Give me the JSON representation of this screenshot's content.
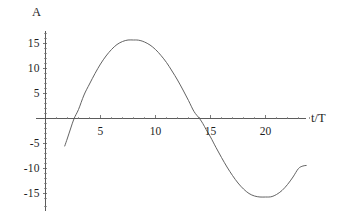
{
  "chart_data": {
    "type": "line",
    "title": "",
    "subtitle": "",
    "xlabel": "t/T",
    "ylabel": "A",
    "xlim": [
      0,
      24.6
    ],
    "ylim": [
      -17.8,
      17.6
    ],
    "grid": false,
    "legend": null,
    "legend_position": "none",
    "x_ticks_major": [
      5,
      10,
      15,
      20
    ],
    "x_tick_labels": [
      "5",
      "10",
      "15",
      "20"
    ],
    "x_ticks_minor": [
      1,
      2,
      3,
      4,
      6,
      7,
      8,
      9,
      11,
      12,
      13,
      14,
      16,
      17,
      18,
      19,
      21,
      22,
      23,
      24
    ],
    "y_ticks_major": [
      15,
      10,
      5,
      -5,
      -10,
      -15
    ],
    "y_tick_labels": [
      "15",
      "10",
      "5",
      "-5",
      "-10",
      "-15"
    ],
    "y_ticks_minor": [
      -17.5,
      -16,
      -14,
      -13,
      -12,
      -11,
      -9,
      -8,
      -7,
      -6,
      -4,
      -3,
      -2,
      -1,
      1,
      2,
      3,
      4,
      6,
      7,
      8,
      9,
      11,
      12,
      13,
      14,
      16,
      17
    ],
    "curve_description": "sinusoid A = 15.7 sin(2*pi*(t - 2.3)/24)",
    "amplitude": 15.7,
    "period": 24,
    "phase_zero_crossing": 2.3,
    "zero_crossings": [
      2.3,
      14.3
    ],
    "peak": {
      "x": 8.3,
      "y": 15.7
    },
    "trough": {
      "x": 20.3,
      "y": -15.7
    },
    "series": [
      {
        "name": "A(t/T)",
        "color": "#5b5b5b",
        "x": [
          1.75,
          2.0,
          2.3,
          2.6,
          3.0,
          3.5,
          4.0,
          4.5,
          5.0,
          5.5,
          6.0,
          6.5,
          7.0,
          7.5,
          8.0,
          8.3,
          8.6,
          9.0,
          9.5,
          10.0,
          10.5,
          11.0,
          11.5,
          12.0,
          12.5,
          13.0,
          13.5,
          14.0,
          14.3,
          14.6,
          15.0,
          15.5,
          16.0,
          16.5,
          17.0,
          17.5,
          18.0,
          18.5,
          19.0,
          19.5,
          20.0,
          20.3,
          20.6,
          21.0,
          21.5,
          22.0,
          22.5,
          23.0,
          23.4,
          23.7
        ],
        "y": [
          -5.5,
          -3.9,
          -1.9,
          0.0,
          1.8,
          4.7,
          6.9,
          9.0,
          10.9,
          12.5,
          13.8,
          14.8,
          15.4,
          15.7,
          15.7,
          15.7,
          15.6,
          15.3,
          14.7,
          13.8,
          12.6,
          11.2,
          9.5,
          7.7,
          5.7,
          3.6,
          1.4,
          0.0,
          -1.0,
          -2.2,
          -3.7,
          -5.8,
          -7.8,
          -9.7,
          -11.4,
          -12.9,
          -14.1,
          -15.0,
          -15.5,
          -15.7,
          -15.7,
          -15.7,
          -15.6,
          -15.2,
          -14.4,
          -13.2,
          -11.7,
          -10.0,
          -9.5,
          -9.4
        ]
      }
    ]
  },
  "labels": {
    "y_axis_title": "A",
    "x_axis_title": "t/T",
    "y_ticks": [
      "15",
      "10",
      "5",
      "-5",
      "-10",
      "-15"
    ],
    "x_ticks": [
      "5",
      "10",
      "15",
      "20"
    ]
  }
}
